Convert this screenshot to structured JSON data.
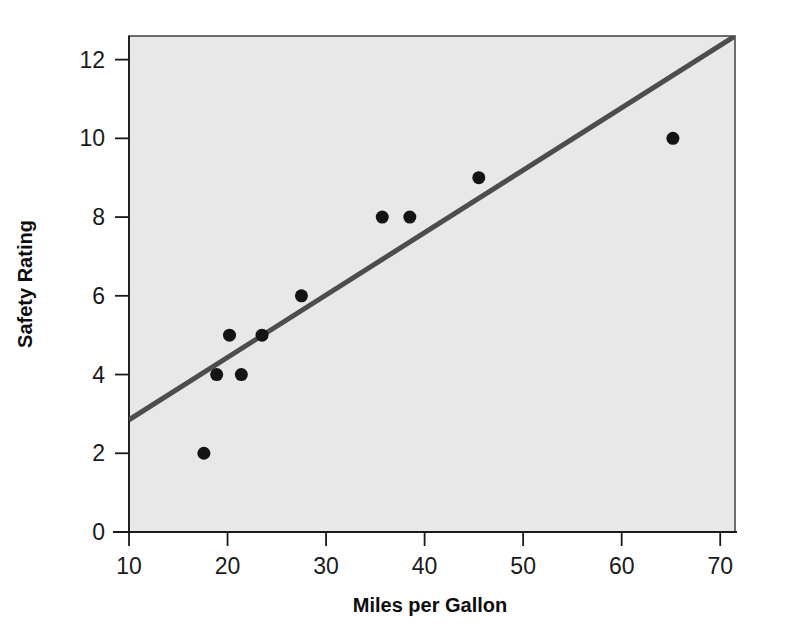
{
  "chart_data": {
    "type": "scatter",
    "title": "",
    "xlabel": "Miles per Gallon",
    "ylabel": "Safety Rating",
    "xlim": [
      10,
      71.5
    ],
    "ylim": [
      0,
      12.6
    ],
    "xticks": [
      10,
      20,
      30,
      40,
      50,
      60,
      70
    ],
    "xtick_labels": [
      "10",
      "20",
      "30",
      "40",
      "50",
      "60",
      "70"
    ],
    "yticks": [
      0,
      2,
      4,
      6,
      8,
      10,
      12
    ],
    "ytick_labels": [
      "0",
      "2",
      "4",
      "6",
      "8",
      "10",
      "12"
    ],
    "grid": false,
    "legend": null,
    "plot_background": "#e8e8e8",
    "frame_color": "#4a4a4a",
    "marker_color": "#141414",
    "marker_shape": "circle",
    "marker_size": 13,
    "points": [
      {
        "x": 17.6,
        "y": 2
      },
      {
        "x": 18.9,
        "y": 4
      },
      {
        "x": 21.4,
        "y": 4
      },
      {
        "x": 20.2,
        "y": 5
      },
      {
        "x": 23.5,
        "y": 5
      },
      {
        "x": 27.5,
        "y": 6
      },
      {
        "x": 35.7,
        "y": 8
      },
      {
        "x": 38.5,
        "y": 8
      },
      {
        "x": 45.5,
        "y": 9
      },
      {
        "x": 65.2,
        "y": 10
      }
    ],
    "trendline": {
      "name": "fit-line",
      "color": "#4d4d4d",
      "width": 5,
      "x_start": 10,
      "y_start": 2.85,
      "x_end": 71.5,
      "y_end": 12.6
    }
  }
}
